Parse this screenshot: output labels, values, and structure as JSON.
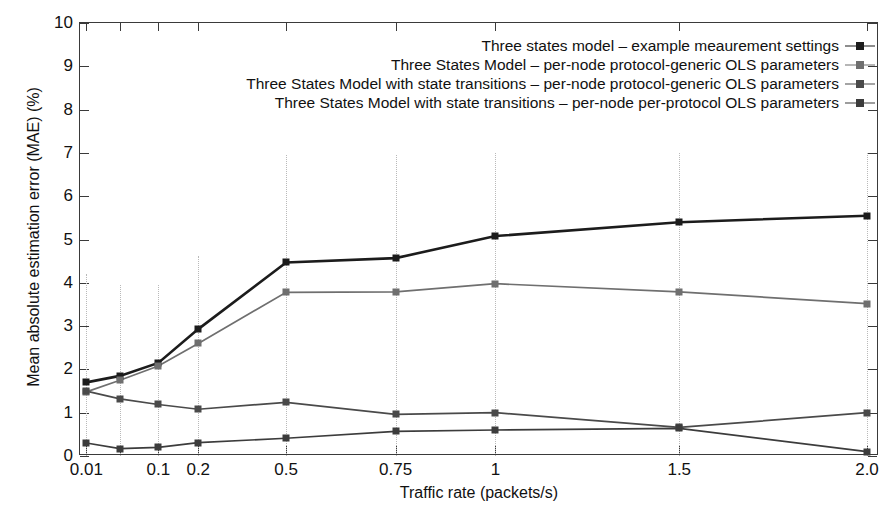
{
  "chart_data": {
    "type": "line",
    "title": "",
    "xlabel": "Traffic rate (packets/s)",
    "ylabel": "Mean absolute estimation error (MAE) (%)",
    "ylim": [
      0,
      10
    ],
    "yticks": [
      0,
      1,
      2,
      3,
      4,
      5,
      6,
      7,
      8,
      9,
      10
    ],
    "ytick_labels": [
      "0",
      "1",
      "2",
      "3",
      "4",
      "5",
      "6",
      "7",
      "8",
      "9",
      "10"
    ],
    "categories": [
      "0.01",
      "0.05",
      "0.1",
      "0.2",
      "0.5",
      "0.75",
      "1",
      "1.5",
      "2.0"
    ],
    "xtick_labels": [
      "0.01",
      "",
      "0.1",
      "0.2",
      "0.5",
      "0.75",
      "1",
      "1.5",
      "2.0"
    ],
    "grid": "vertical dotted gridlines over lower portion of plot",
    "legend_position": "inside top-right",
    "series": [
      {
        "name": "Three states model – example meaurement settings",
        "color": "#1c1c1c",
        "values": [
          1.7,
          1.85,
          2.15,
          2.93,
          4.47,
          4.57,
          5.08,
          5.4,
          5.55
        ]
      },
      {
        "name": "Three States Model – per-node protocol-generic OLS parameters",
        "color": "#6f6f6f",
        "values": [
          1.48,
          1.75,
          2.08,
          2.6,
          3.78,
          3.79,
          3.98,
          3.79,
          3.52
        ]
      },
      {
        "name": "Three States Model with state transitions – per-node protocol-generic OLS parameters",
        "color": "#4a4a4a",
        "values": [
          1.5,
          1.32,
          1.19,
          1.08,
          1.24,
          0.96,
          1.0,
          0.66,
          1.0
        ]
      },
      {
        "name": "Three States Model with state transitions – per-node per-protocol OLS parameters",
        "color": "#3c3c3c",
        "values": [
          0.3,
          0.17,
          0.2,
          0.31,
          0.41,
          0.57,
          0.6,
          0.64,
          0.1
        ]
      }
    ],
    "error_bars": {
      "note": "faint dotted vertical whiskers at the low traffic-rate columns",
      "columns": [
        "0.01",
        "0.05",
        "0.1",
        "0.2",
        "0.5",
        "0.75",
        "1",
        "1.5",
        "2.0"
      ],
      "tops": [
        4.2,
        3.95,
        3.95,
        4.62,
        6.95,
        6.95,
        7.0,
        7.0,
        7.0
      ]
    }
  }
}
